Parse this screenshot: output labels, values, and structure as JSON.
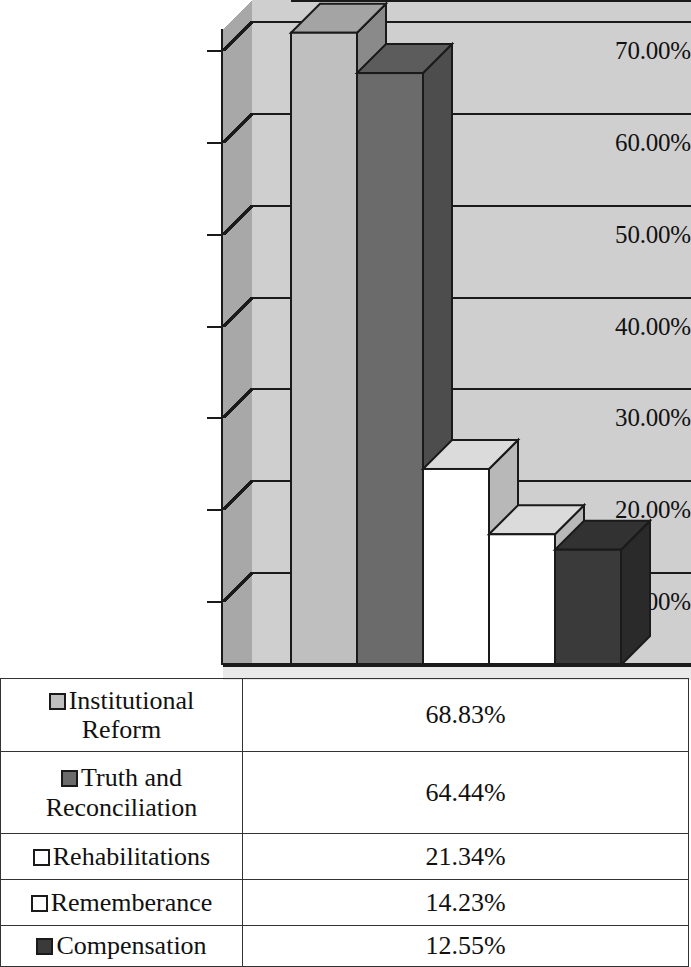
{
  "chart_data": {
    "type": "bar",
    "title": "",
    "subtitle": "",
    "xlabel": "",
    "ylabel": "",
    "categories": [
      "Institutional Reform",
      "Truth and Reconciliation",
      "Rehabilitations",
      "Rememberance",
      "Compensation"
    ],
    "values": [
      68.83,
      64.44,
      21.34,
      14.23,
      12.55
    ],
    "value_labels": [
      "68.83%",
      "64.44%",
      "21.34%",
      "14.23%",
      "12.55%"
    ],
    "ylim": [
      0,
      70
    ],
    "y_tick_labels": [
      "70.00%",
      "60.00%",
      "50.00%",
      "40.00%",
      "30.00%",
      "20.00%",
      "10.00%",
      "0.00%"
    ],
    "y_tick_values": [
      70,
      60,
      50,
      40,
      30,
      20,
      10,
      0
    ],
    "grid": true,
    "legend_position": "bottom-table",
    "three_d": true,
    "series_colors": [
      "#bfbfbf",
      "#6b6b6b",
      "#ffffff",
      "#ffffff",
      "#3a3a3a"
    ],
    "plot_background": "#cfcfcf",
    "gridline_color": "#1a1a1a"
  },
  "axis": {
    "ticks": [
      {
        "label": "70.00%",
        "value": 70
      },
      {
        "label": "60.00%",
        "value": 60
      },
      {
        "label": "50.00%",
        "value": 50
      },
      {
        "label": "40.00%",
        "value": 40
      },
      {
        "label": "30.00%",
        "value": 30
      },
      {
        "label": "20.00%",
        "value": 20
      },
      {
        "label": "10.00%",
        "value": 10
      },
      {
        "label": "0.00%",
        "value": 0
      }
    ]
  },
  "legend": {
    "rows": [
      {
        "name": "Institutional Reform",
        "name_line1": "Institutional",
        "name_line2": "Reform",
        "value": "68.83%",
        "swatch": "#bfbfbf",
        "swatch_name": "legend-swatch-institutional-reform"
      },
      {
        "name": "Truth and Reconciliation",
        "name_line1": "Truth and",
        "name_line2": "Reconciliation",
        "value": "64.44%",
        "swatch": "#6b6b6b",
        "swatch_name": "legend-swatch-truth-and-reconciliation"
      },
      {
        "name": "Rehabilitations",
        "name_line1": "Rehabilitations",
        "name_line2": "",
        "value": "21.34%",
        "swatch": "#ffffff",
        "swatch_name": "legend-swatch-rehabilitations"
      },
      {
        "name": "Rememberance",
        "name_line1": "Rememberance",
        "name_line2": "",
        "value": "14.23%",
        "swatch": "#ffffff",
        "swatch_name": "legend-swatch-rememberance"
      },
      {
        "name": "Compensation",
        "name_line1": "Compensation",
        "name_line2": "",
        "value": "12.55%",
        "swatch": "#3a3a3a",
        "swatch_name": "legend-swatch-compensation"
      }
    ]
  }
}
